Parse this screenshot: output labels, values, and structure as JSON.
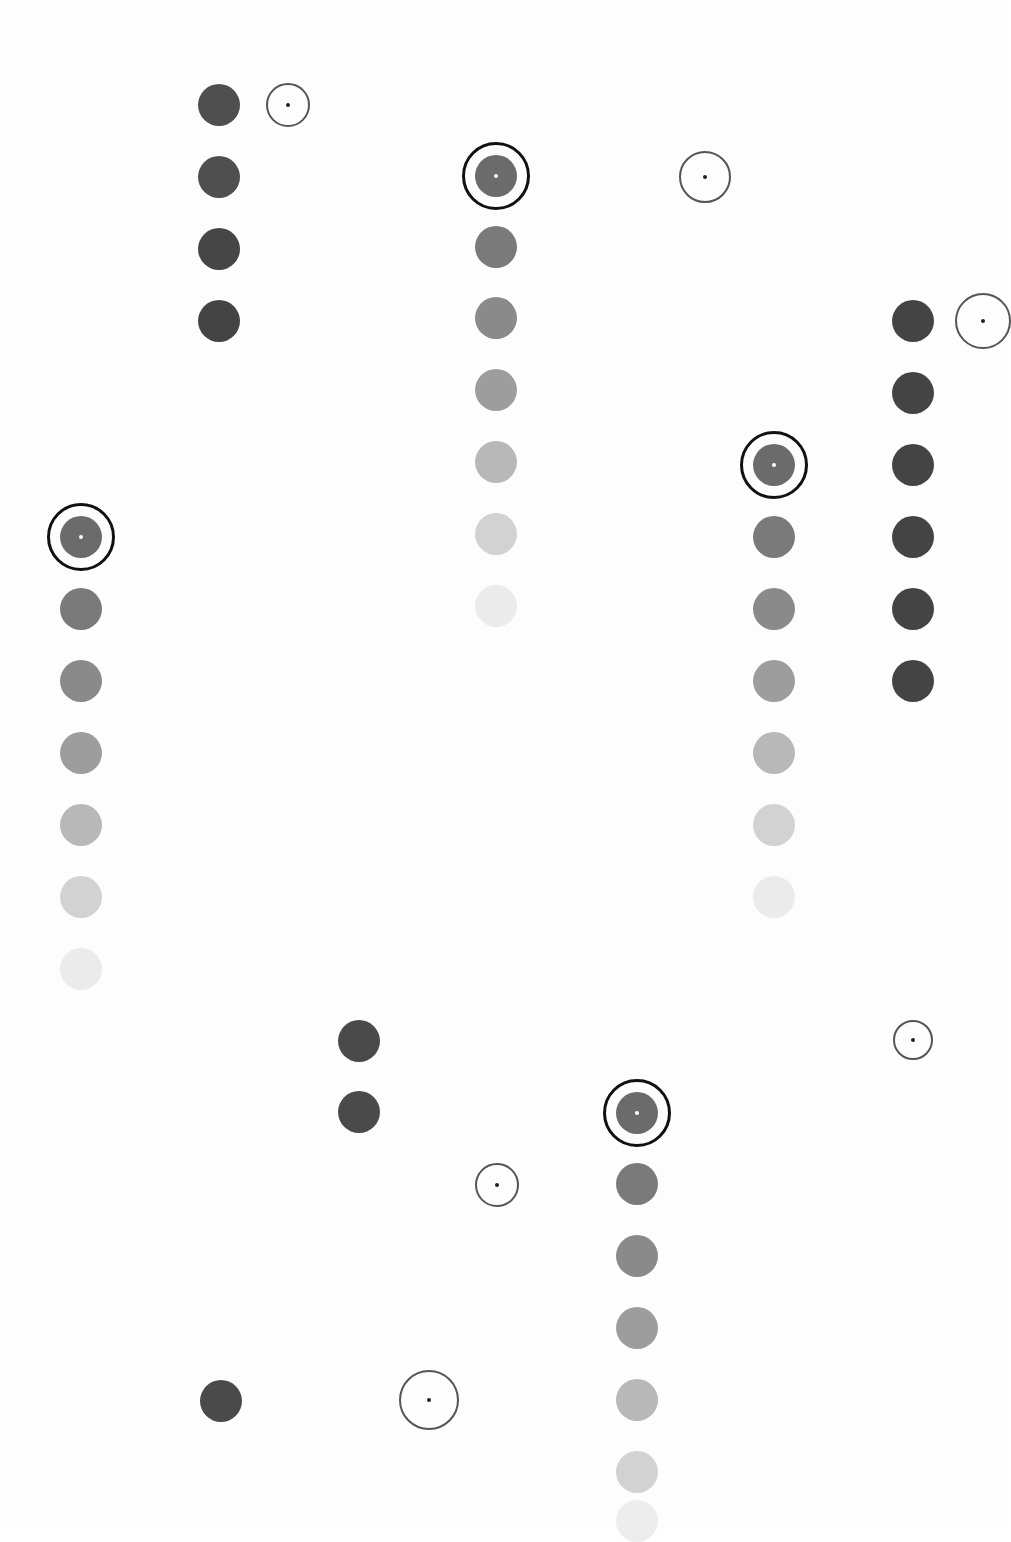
{
  "canvas": {
    "width": 1007,
    "height": 1529,
    "background": "#fdfdfd"
  },
  "colors": {
    "dark": "#4a4a4a",
    "ring_thick": "#111111",
    "ring_thin": "#555555",
    "center_black": "#222222",
    "center_white": "#ffffff",
    "fade_steps": [
      "#6b6b6b",
      "#7a7a7a",
      "#8e8e8e",
      "#a3a3a3",
      "#bdbdbd",
      "#d4d4d4",
      "#e9e9e9"
    ]
  },
  "dot_radius": 21,
  "columns": [
    {
      "id": "col-219",
      "x": 219,
      "dots": [
        {
          "y": 105,
          "color": "#4f4f4f"
        },
        {
          "y": 177,
          "color": "#4f4f4f"
        },
        {
          "y": 249,
          "color": "#464646"
        },
        {
          "y": 321,
          "color": "#444444"
        }
      ]
    },
    {
      "id": "col-496",
      "x": 496,
      "target": {
        "y": 176
      },
      "dots": [
        {
          "y": 176,
          "color": "#6b6b6b"
        },
        {
          "y": 247,
          "color": "#7a7a7a"
        },
        {
          "y": 318,
          "color": "#8a8a8a"
        },
        {
          "y": 390,
          "color": "#9d9d9d"
        },
        {
          "y": 462,
          "color": "#b8b8b8"
        },
        {
          "y": 534,
          "color": "#d2d2d2"
        },
        {
          "y": 606,
          "color": "#ebebeb"
        }
      ]
    },
    {
      "id": "col-81",
      "x": 81,
      "target": {
        "y": 537
      },
      "dots": [
        {
          "y": 537,
          "color": "#6b6b6b"
        },
        {
          "y": 609,
          "color": "#7a7a7a"
        },
        {
          "y": 681,
          "color": "#8a8a8a"
        },
        {
          "y": 753,
          "color": "#9d9d9d"
        },
        {
          "y": 825,
          "color": "#b8b8b8"
        },
        {
          "y": 897,
          "color": "#d2d2d2"
        },
        {
          "y": 969,
          "color": "#ebebeb"
        }
      ]
    },
    {
      "id": "col-774",
      "x": 774,
      "target": {
        "y": 465
      },
      "dots": [
        {
          "y": 465,
          "color": "#6b6b6b"
        },
        {
          "y": 537,
          "color": "#7a7a7a"
        },
        {
          "y": 609,
          "color": "#8a8a8a"
        },
        {
          "y": 681,
          "color": "#9d9d9d"
        },
        {
          "y": 753,
          "color": "#b8b8b8"
        },
        {
          "y": 825,
          "color": "#d2d2d2"
        },
        {
          "y": 897,
          "color": "#ebebeb"
        }
      ]
    },
    {
      "id": "col-913",
      "x": 913,
      "dots": [
        {
          "y": 321,
          "color": "#444444"
        },
        {
          "y": 393,
          "color": "#444444"
        },
        {
          "y": 465,
          "color": "#444444"
        },
        {
          "y": 537,
          "color": "#444444"
        },
        {
          "y": 609,
          "color": "#444444"
        },
        {
          "y": 681,
          "color": "#444444"
        }
      ]
    },
    {
      "id": "col-359",
      "x": 359,
      "dots": [
        {
          "y": 1041,
          "color": "#4a4a4a"
        },
        {
          "y": 1112,
          "color": "#4a4a4a"
        }
      ]
    },
    {
      "id": "col-637",
      "x": 637,
      "target": {
        "y": 1113
      },
      "dots": [
        {
          "y": 1113,
          "color": "#6b6b6b"
        },
        {
          "y": 1184,
          "color": "#7a7a7a"
        },
        {
          "y": 1256,
          "color": "#8a8a8a"
        },
        {
          "y": 1328,
          "color": "#9d9d9d"
        },
        {
          "y": 1400,
          "color": "#b8b8b8"
        },
        {
          "y": 1472,
          "color": "#d2d2d2"
        },
        {
          "y": 1521,
          "color": "#ededed"
        }
      ]
    },
    {
      "id": "col-221-bottom",
      "x": 221,
      "dots": [
        {
          "y": 1401,
          "color": "#4a4a4a"
        }
      ]
    }
  ],
  "thin_rings": [
    {
      "id": "ring-288-105",
      "x": 288,
      "y": 105,
      "r": 22
    },
    {
      "id": "ring-705-177",
      "x": 705,
      "y": 177,
      "r": 26
    },
    {
      "id": "ring-983-321",
      "x": 983,
      "y": 321,
      "r": 28
    },
    {
      "id": "ring-913-1040",
      "x": 913,
      "y": 1040,
      "r": 20
    },
    {
      "id": "ring-497-1185",
      "x": 497,
      "y": 1185,
      "r": 22
    },
    {
      "id": "ring-429-1400",
      "x": 429,
      "y": 1400,
      "r": 30
    }
  ],
  "target_ring_radius": 34
}
